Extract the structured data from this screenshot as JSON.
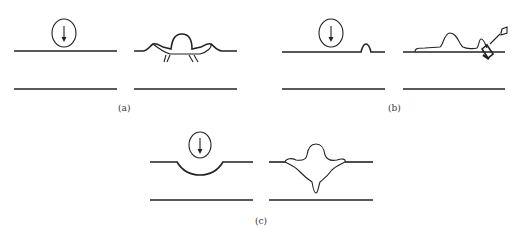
{
  "figure": {
    "panels": [
      {
        "id": "a",
        "label": "(a)",
        "description": "Circle with downward arrow above flat surface; result shows a bulge with lateral ridges and short cracks beneath",
        "before": "circle-with-down-arrow above flat top line",
        "after": "dome bump with raised shoulders and small fracture lines under the surface"
      },
      {
        "id": "b",
        "label": "(b)",
        "description": "Circle with downward arrow above flat surface with small bump; result shows wave bump and ejected fragment",
        "before": "circle-with-down-arrow above top line with small bump",
        "after": "wavy surface layer with rounded bump, tilted fragment and flying particle"
      },
      {
        "id": "c",
        "label": "(c)",
        "description": "Circle with downward arrow above surface with circular depression; result shows mushroom-shaped crater with downward spike",
        "before": "circle-with-down-arrow above top line with concave dip",
        "after": "mushroom bulge above surface with rim lips and penetration spike below"
      }
    ],
    "colors": {
      "line": "#222222",
      "background": "#ffffff",
      "caption": "#333333"
    }
  }
}
